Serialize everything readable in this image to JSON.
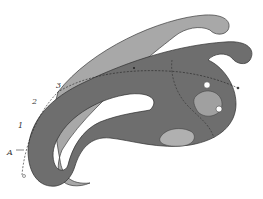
{
  "figure": {
    "labels": {
      "point_a": "A",
      "point_1": "1",
      "point_2": "2",
      "point_3": "3"
    },
    "colors": {
      "dark_curve": "#6e6e6e",
      "light_curve": "#a6a6a6",
      "outline": "#3a3a3a",
      "background": "#ffffff"
    }
  }
}
